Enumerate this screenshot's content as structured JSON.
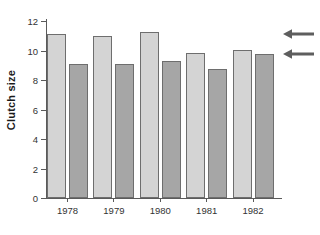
{
  "chart_data": {
    "type": "bar",
    "title": "",
    "xlabel": "",
    "ylabel": "Clutch size",
    "categories": [
      "1978",
      "1979",
      "1980",
      "1981",
      "1982"
    ],
    "ylim": [
      0,
      12
    ],
    "yticks": [
      0,
      2,
      4,
      6,
      8,
      10,
      12
    ],
    "ytick_labels": [
      "0",
      "2",
      "4",
      "6",
      "8",
      "10",
      "12"
    ],
    "grid": false,
    "legend": "none",
    "series": [
      {
        "name": "light-bars",
        "color": "#d4d4d4",
        "values": [
          11.1,
          11.0,
          11.25,
          9.85,
          10.05
        ]
      },
      {
        "name": "dark-bars",
        "color": "#a6a6a6",
        "values": [
          9.1,
          9.1,
          9.3,
          8.75,
          9.75
        ]
      }
    ],
    "annotations": [
      {
        "name": "upper-arrow",
        "symbol": "←",
        "value": 11.1
      },
      {
        "name": "lower-arrow",
        "symbol": "←",
        "value": 9.75
      }
    ]
  }
}
